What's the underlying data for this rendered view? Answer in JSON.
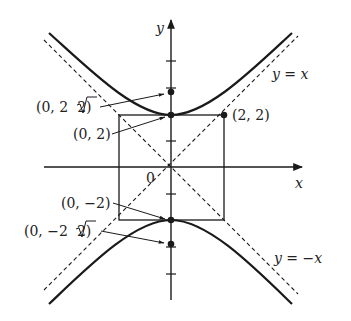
{
  "diagram": {
    "type": "hyperbola",
    "equation": "y^2 - x^2 = 4",
    "axes": {
      "x_label": "x",
      "y_label": "y",
      "origin_label": "0"
    },
    "asymptotes": [
      {
        "label": "y = x",
        "style": "dashed"
      },
      {
        "label": "y = −x",
        "style": "dashed"
      }
    ],
    "points": [
      {
        "label": "(0, 2√2)",
        "label_parts": [
          "(0, 2",
          "2",
          ")"
        ],
        "x": 0,
        "y": 2.828,
        "role": "focus"
      },
      {
        "label": "(0, 2)",
        "x": 0,
        "y": 2,
        "role": "vertex"
      },
      {
        "label": "(2, 2)",
        "x": 2,
        "y": 2,
        "role": "box-corner"
      },
      {
        "label": "(0, −2)",
        "x": 0,
        "y": -2,
        "role": "vertex"
      },
      {
        "label": "(0, −2√2)",
        "label_parts": [
          "(0, −2",
          "2",
          ")"
        ],
        "x": 0,
        "y": -2.828,
        "role": "focus"
      }
    ],
    "central_box": {
      "x_min": -2,
      "x_max": 2,
      "y_min": -2,
      "y_max": 2
    },
    "colors": {
      "stroke": "#1a1a1a",
      "background": "#ffffff"
    }
  }
}
